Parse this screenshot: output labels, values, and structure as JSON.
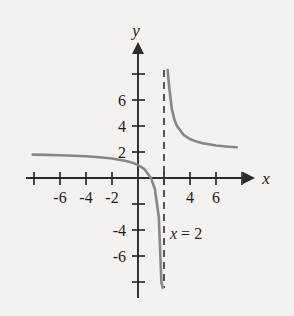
{
  "figure": {
    "background_color": "#f3f2f0",
    "axis_color": "#2b2b2b",
    "curve_color": "#878787",
    "asymptote_color": "#3a3a3a",
    "x_axis_name": "x",
    "y_axis_name": "y",
    "annotation": {
      "variable": "x",
      "equals": "=",
      "value": "2",
      "full": "x = 2"
    }
  },
  "chart_data": {
    "type": "line",
    "title": "",
    "xlabel": "x",
    "ylabel": "y",
    "xlim": [
      -8.6,
      8.8
    ],
    "ylim": [
      -9.0,
      9.0
    ],
    "grid": false,
    "legend": null,
    "x_ticks": [
      -8,
      -6,
      -4,
      -2,
      2,
      4,
      6,
      8
    ],
    "x_tick_labels": [
      "",
      "-6",
      "-4",
      "-2",
      "",
      "4",
      "6",
      ""
    ],
    "y_ticks": [
      -8,
      -6,
      -4,
      -2,
      2,
      4,
      6,
      8
    ],
    "y_tick_labels": [
      "",
      "-6",
      "-4",
      "",
      "2",
      "4",
      "6",
      ""
    ],
    "annotations": [
      {
        "text": "x = 2",
        "x": 2.3,
        "y": -4.2
      }
    ],
    "vertical_asymptote": {
      "x": 2,
      "label": "x = 2",
      "style": "dashed"
    },
    "horizontal_asymptote": {
      "y": 2,
      "style": "none"
    },
    "function": "y = 2 + 2/(x - 2)",
    "series": [
      {
        "name": "left branch",
        "x": [
          -8.1,
          -7.0,
          -6.0,
          -5.0,
          -4.0,
          -3.0,
          -2.0,
          -1.0,
          -0.5,
          0.0,
          0.5,
          1.0,
          1.3,
          1.6,
          1.8,
          1.9
        ],
        "y": [
          1.8,
          1.78,
          1.75,
          1.71,
          1.67,
          1.6,
          1.5,
          1.33,
          1.2,
          1.0,
          0.67,
          0.0,
          -0.86,
          -3.0,
          -8.0,
          -16.0
        ]
      },
      {
        "name": "right branch",
        "x": [
          2.28,
          2.4,
          2.6,
          2.8,
          3.0,
          3.5,
          4.0,
          4.5,
          5.0,
          6.0,
          7.0,
          7.6
        ],
        "y": [
          9.1,
          7.0,
          5.33,
          4.5,
          4.0,
          3.33,
          3.0,
          2.8,
          2.67,
          2.5,
          2.4,
          2.36
        ]
      }
    ]
  }
}
